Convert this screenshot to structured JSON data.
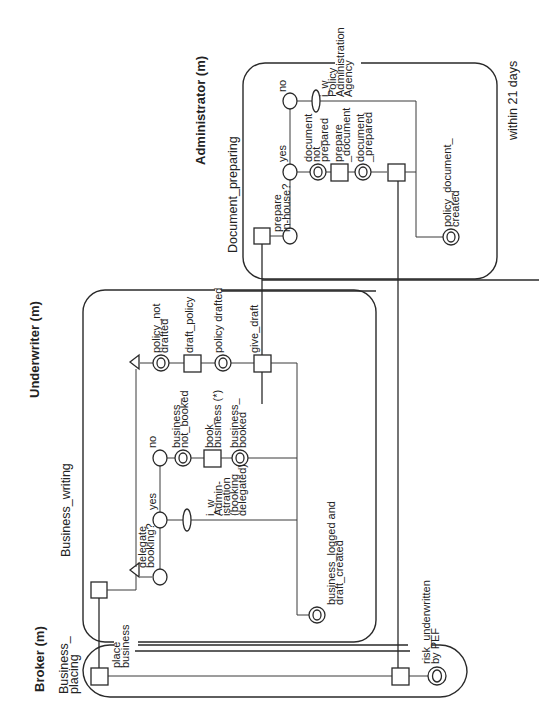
{
  "diagram": {
    "orientation": "rotated-90-ccw",
    "lanes": [
      {
        "id": "administrator",
        "title": "Administrator (m)",
        "process": "Document_preparing",
        "constraint": "within 21 days"
      },
      {
        "id": "underwriter",
        "title": "Underwriter (m)",
        "process": "Business_writing"
      },
      {
        "id": "broker",
        "title": "Broker (m)",
        "process": "Business_\nplacing"
      }
    ],
    "labels": {
      "admin_title": "Administrator (m)",
      "admin_process": "Document_preparing",
      "admin_constraint": "within 21 days",
      "admin_prepare_inhouse_1": "prepare",
      "admin_prepare_inhouse_2": "in-house?",
      "admin_yes": "yes",
      "admin_no": "no",
      "admin_doc_not_prepared_1": "document",
      "admin_doc_not_prepared_2": "not_",
      "admin_doc_not_prepared_3": "prepared",
      "admin_prepare_document_1": "prepare",
      "admin_prepare_document_2": "_document",
      "admin_doc_prepared_1": "document",
      "admin_doc_prepared_2": "_prepared",
      "admin_iw_1": "i_w",
      "admin_iw_2": "Policy",
      "admin_iw_3": "Administration",
      "admin_iw_4": "Agency",
      "admin_policy_doc_created_1": "policy_document_",
      "admin_policy_doc_created_2": "created",
      "uw_title": "Underwriter (m)",
      "uw_process": "Business_writing",
      "uw_delegate_1": "delegate",
      "uw_delegate_2": "booking?",
      "uw_yes": "yes",
      "uw_no": "no",
      "uw_iw_1": "i_w",
      "uw_iw_2": "Admin-",
      "uw_iw_3": "istration",
      "uw_iw_4": "(booking",
      "uw_iw_5": "delegated)",
      "uw_not_booked_1": "business_",
      "uw_not_booked_2": "not_booked",
      "uw_book_1": "book_",
      "uw_book_2": "business (*)",
      "uw_booked_1": "business_",
      "uw_booked_2": "booked",
      "uw_policy_not_drafted_1": "policy_not",
      "uw_policy_not_drafted_2": "drafted",
      "uw_draft_policy": "draft_policy",
      "uw_policy_drafted": "policy drafted",
      "uw_give_draft": "give_draft",
      "uw_logged_1": "business_logged and",
      "uw_logged_2": "draft_created",
      "br_title": "Broker (m)",
      "br_process_1": "Business_",
      "br_process_2": "placing",
      "br_place_1": "place",
      "br_place_2": "business",
      "br_risk_1": "risk_underwritten",
      "br_risk_2": "by PEF"
    },
    "node_types": {
      "event": "double-circle",
      "activity": "square",
      "decision-branch": "circle",
      "information-object": "ellipse",
      "process-interface": "triangle"
    },
    "colors": {
      "line": "#2a2a2a",
      "background": "#ffffff",
      "text": "#222222"
    }
  }
}
